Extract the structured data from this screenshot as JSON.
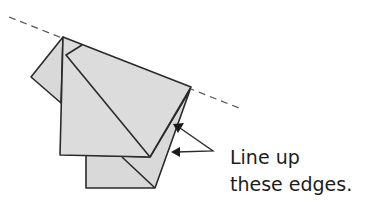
{
  "diagram": {
    "type": "origami-fold-step",
    "instruction": {
      "line1": "Line up",
      "line2": "these edges."
    },
    "elements": {
      "fold_line": "dashed-fold-line",
      "paper_layers": [
        "left-flap",
        "front-flap",
        "back-layer"
      ],
      "arrows": 2
    },
    "colors": {
      "paper": "#d9d9d9",
      "outline": "#2a2a2a",
      "dashed_line": "#555555",
      "text": "#1c1c1c",
      "background": "#ffffff"
    }
  }
}
